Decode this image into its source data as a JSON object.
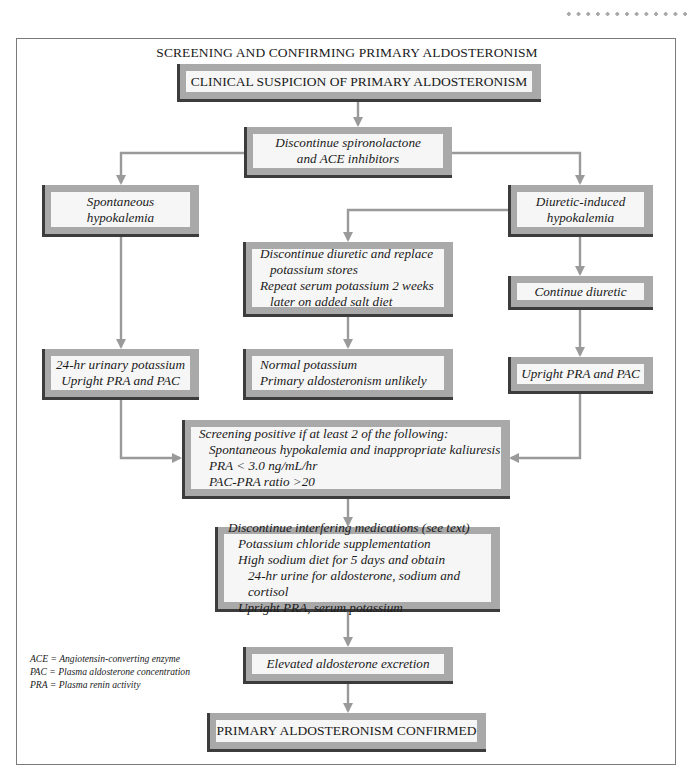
{
  "decoration": {
    "dots_count": 13,
    "dot_color": "#a9a9a9"
  },
  "colors": {
    "box_frame": "#a9a9a9",
    "box_shadow": "#3c3c3c",
    "box_fill": "#f6f6f6",
    "arrow": "#9a9a9a",
    "border": "#7a7a7a"
  },
  "title": "SCREENING AND CONFIRMING PRIMARY ALDOSTERONISM",
  "nodes": {
    "clinical_suspicion": {
      "lines": [
        "CLINICAL SUSPICION OF PRIMARY ALDOSTERONISM"
      ]
    },
    "discontinue_spironolactone": {
      "lines": [
        "Discontinue spironolactone",
        "and ACE inhibitors"
      ]
    },
    "spontaneous_hypokalemia": {
      "lines": [
        "Spontaneous",
        "hypokalemia"
      ]
    },
    "diuretic_induced_hypokalemia": {
      "lines": [
        "Diuretic-induced",
        "hypokalemia"
      ]
    },
    "discontinue_diuretic": {
      "lines": [
        "Discontinue diuretic and replace",
        "potassium stores",
        "Repeat serum potassium 2 weeks",
        "later on added salt diet"
      ]
    },
    "continue_diuretic": {
      "lines": [
        "Continue diuretic"
      ]
    },
    "urinary_potassium": {
      "lines": [
        "24-hr urinary potassium",
        "Upright PRA and PAC"
      ]
    },
    "normal_potassium": {
      "lines": [
        "Normal potassium",
        "Primary aldosteronism unlikely"
      ]
    },
    "upright_pra_pac": {
      "lines": [
        "Upright PRA and PAC"
      ]
    },
    "screening_positive": {
      "lines": [
        "Screening positive if at least 2 of the following:",
        "Spontaneous hypokalemia and inappropriate kaliuresis",
        "PRA < 3.0 ng/mL/hr",
        "PAC-PRA ratio >20"
      ]
    },
    "discontinue_interfering": {
      "lines": [
        "Discontinue interfering medications (see text)",
        "Potassium chloride supplementation",
        "High sodium diet for 5 days and obtain",
        "24-hr urine for aldosterone, sodium and cortisol",
        "Upright PRA, serum potassium"
      ]
    },
    "elevated_aldosterone": {
      "lines": [
        "Elevated aldosterone excretion"
      ]
    },
    "confirmed": {
      "lines": [
        "PRIMARY ALDOSTERONISM CONFIRMED"
      ]
    }
  },
  "edges": [
    [
      "clinical_suspicion",
      "discontinue_spironolactone"
    ],
    [
      "discontinue_spironolactone",
      "spontaneous_hypokalemia"
    ],
    [
      "discontinue_spironolactone",
      "diuretic_induced_hypokalemia"
    ],
    [
      "diuretic_induced_hypokalemia",
      "discontinue_diuretic"
    ],
    [
      "diuretic_induced_hypokalemia",
      "continue_diuretic"
    ],
    [
      "spontaneous_hypokalemia",
      "urinary_potassium"
    ],
    [
      "discontinue_diuretic",
      "normal_potassium"
    ],
    [
      "continue_diuretic",
      "upright_pra_pac"
    ],
    [
      "urinary_potassium",
      "screening_positive"
    ],
    [
      "upright_pra_pac",
      "screening_positive"
    ],
    [
      "screening_positive",
      "discontinue_interfering"
    ],
    [
      "discontinue_interfering",
      "elevated_aldosterone"
    ],
    [
      "elevated_aldosterone",
      "confirmed"
    ]
  ],
  "legend": [
    "ACE = Angiotensin-converting enzyme",
    "PAC = Plasma aldosterone concentration",
    "PRA = Plasma renin activity"
  ]
}
